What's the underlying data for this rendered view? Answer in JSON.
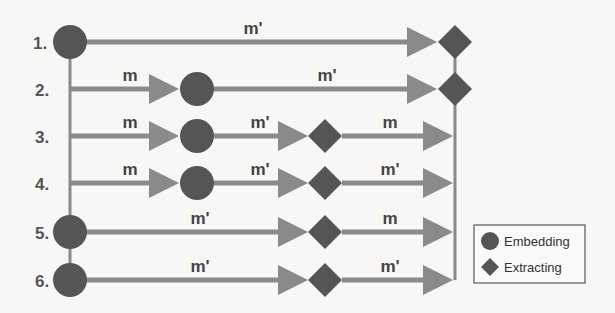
{
  "diagram": {
    "colors": {
      "background": "#f7f7f5",
      "node": "#555555",
      "arrow": "#8a8a8a",
      "text": "#444444"
    },
    "scenarios": [
      {
        "label": "1.",
        "segments": [
          {
            "text": "m'"
          }
        ],
        "nodes": [
          "embedding",
          "extracting"
        ]
      },
      {
        "label": "2.",
        "segments": [
          {
            "text": "m"
          },
          {
            "text": "m'"
          }
        ],
        "nodes": [
          "embedding",
          "extracting"
        ]
      },
      {
        "label": "3.",
        "segments": [
          {
            "text": "m"
          },
          {
            "text": "m'"
          },
          {
            "text": "m"
          }
        ],
        "nodes": [
          "embedding",
          "extracting"
        ]
      },
      {
        "label": "4.",
        "segments": [
          {
            "text": "m"
          },
          {
            "text": "m'"
          },
          {
            "text": "m'"
          }
        ],
        "nodes": [
          "embedding",
          "extracting"
        ]
      },
      {
        "label": "5.",
        "segments": [
          {
            "text": "m'"
          },
          {
            "text": "m"
          }
        ],
        "nodes": [
          "embedding",
          "extracting"
        ]
      },
      {
        "label": "6.",
        "segments": [
          {
            "text": "m'"
          },
          {
            "text": "m'"
          }
        ],
        "nodes": [
          "embedding",
          "extracting"
        ]
      }
    ],
    "legend": {
      "items": [
        {
          "icon": "circle",
          "label": "Embedding"
        },
        {
          "icon": "diamond",
          "label": "Extracting"
        }
      ]
    }
  }
}
